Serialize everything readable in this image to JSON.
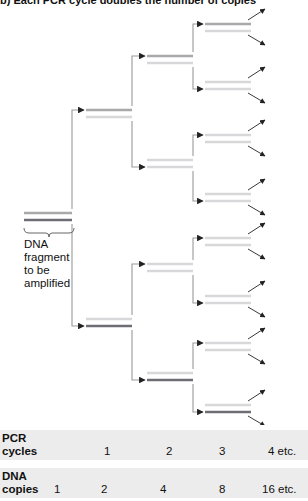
{
  "caption": "b) Each PCR cycle doubles the number of copies",
  "fragment_label": [
    "DNA",
    "fragment",
    "to be",
    "amplified"
  ],
  "colors": {
    "strand_dark": "#6f6c73",
    "strand_medium": "#a9a9ac",
    "strand_light": "#d8d8da",
    "connector": "#9a9a9a",
    "arrow": "#222222",
    "band": "#ececec"
  },
  "diagram": {
    "original": {
      "x1": 24,
      "x2": 72,
      "strands": [
        {
          "y": 213,
          "tone": "medium"
        },
        {
          "y": 220,
          "tone": "dark"
        }
      ]
    },
    "cycles": [
      {
        "x1": 86,
        "x2": 132,
        "pairs": [
          [
            {
              "y": 110,
              "tone": "medium"
            },
            {
              "y": 117,
              "tone": "light"
            }
          ],
          [
            {
              "y": 319,
              "tone": "light"
            },
            {
              "y": 326,
              "tone": "dark"
            }
          ]
        ]
      },
      {
        "x1": 147,
        "x2": 193,
        "pairs": [
          [
            {
              "y": 56,
              "tone": "medium"
            },
            {
              "y": 63,
              "tone": "light"
            }
          ],
          [
            {
              "y": 160,
              "tone": "light"
            },
            {
              "y": 167,
              "tone": "light"
            }
          ],
          [
            {
              "y": 264,
              "tone": "light"
            },
            {
              "y": 271,
              "tone": "light"
            }
          ],
          [
            {
              "y": 373,
              "tone": "light"
            },
            {
              "y": 380,
              "tone": "dark"
            }
          ]
        ]
      },
      {
        "x1": 205,
        "x2": 251,
        "pairs": [
          [
            {
              "y": 24,
              "tone": "medium"
            },
            {
              "y": 31,
              "tone": "light"
            }
          ],
          [
            {
              "y": 82,
              "tone": "light"
            },
            {
              "y": 89,
              "tone": "light"
            }
          ],
          [
            {
              "y": 135,
              "tone": "light"
            },
            {
              "y": 142,
              "tone": "light"
            }
          ],
          [
            {
              "y": 194,
              "tone": "light"
            },
            {
              "y": 201,
              "tone": "light"
            }
          ],
          [
            {
              "y": 238,
              "tone": "light"
            },
            {
              "y": 245,
              "tone": "light"
            }
          ],
          [
            {
              "y": 296,
              "tone": "light"
            },
            {
              "y": 303,
              "tone": "light"
            }
          ],
          [
            {
              "y": 343,
              "tone": "light"
            },
            {
              "y": 350,
              "tone": "light"
            }
          ],
          [
            {
              "y": 405,
              "tone": "light"
            },
            {
              "y": 412,
              "tone": "dark"
            }
          ]
        ]
      }
    ]
  },
  "table": {
    "pcr_cycles": {
      "label": [
        "PCR",
        "cycles"
      ],
      "values": [
        {
          "text": "1",
          "x": 104
        },
        {
          "text": "2",
          "x": 166
        },
        {
          "text": "3",
          "x": 219
        },
        {
          "text": "4  etc.",
          "x": 268
        }
      ]
    },
    "dna_copies": {
      "label": [
        "DNA",
        "copies"
      ],
      "first": "1",
      "values": [
        {
          "text": "2",
          "x": 101
        },
        {
          "text": "4",
          "x": 160
        },
        {
          "text": "8",
          "x": 219
        },
        {
          "text": "16  etc.",
          "x": 262
        }
      ]
    }
  }
}
